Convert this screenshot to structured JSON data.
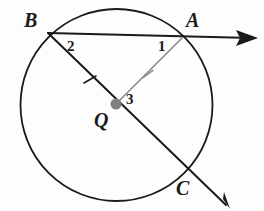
{
  "figure": {
    "type": "geometry-diagram",
    "background_color": "#fdfdfd",
    "stroke_color": "#1a1a1a",
    "accent_color": "#8a8a8a",
    "center_dot_color": "#808080"
  },
  "circle": {
    "name": "circle-Q",
    "center_label": "Q",
    "cx": 116.5,
    "cy": 105,
    "r": 96,
    "stroke": "#1a1a1a",
    "stroke_width": 1.8
  },
  "points": [
    {
      "id": "A",
      "label": "A",
      "x": 182,
      "y": 38,
      "label_x": 186,
      "label_y": 10
    },
    {
      "id": "B",
      "label": "B",
      "x": 48,
      "y": 33,
      "label_x": 24,
      "label_y": 10
    },
    {
      "id": "C",
      "label": "C",
      "x": 187,
      "y": 175,
      "label_x": 176,
      "label_y": 178
    },
    {
      "id": "Q",
      "label": "Q",
      "x": 116,
      "y": 104,
      "label_x": 94,
      "label_y": 110
    }
  ],
  "angles": [
    {
      "id": "1",
      "label": "1",
      "x": 159,
      "y": 40,
      "at_vertex": "A"
    },
    {
      "id": "2",
      "label": "2",
      "x": 68,
      "y": 40,
      "at_vertex": "B"
    },
    {
      "id": "3",
      "label": "3",
      "x": 127,
      "y": 93,
      "at_vertex": "Q"
    }
  ],
  "segments": [
    {
      "id": "ray-BA",
      "name": "ray-b-a",
      "from": "B",
      "to": "arrow-right",
      "x1": 48,
      "y1": 33,
      "x2": 252,
      "y2": 38,
      "color": "#1a1a1a",
      "width": 1.8,
      "arrow_end": true
    },
    {
      "id": "ray-BC",
      "name": "ray-b-through-q-to-c",
      "from": "B",
      "to": "arrow-lower-right",
      "x1": 48,
      "y1": 33,
      "x2": 224,
      "y2": 203,
      "color": "#1a1a1a",
      "width": 2.0,
      "arrow_end": true
    },
    {
      "id": "radius-QA",
      "name": "radius-q-a",
      "from": "Q",
      "to": "A",
      "x1": 116,
      "y1": 104,
      "x2": 182,
      "y2": 38,
      "color": "#8a8a8a",
      "width": 1.6,
      "arrow_end": false
    }
  ],
  "tick_marks": [
    {
      "id": "tick-QB",
      "name": "congruence-tick-radius-qb",
      "x": 90,
      "y": 80,
      "color": "#1a1a1a"
    },
    {
      "id": "tick-QA",
      "name": "congruence-tick-radius-qa",
      "x": 148,
      "y": 73,
      "color": "#8a8a8a"
    }
  ],
  "arrowheads": [
    {
      "id": "arrow-right",
      "name": "arrowhead-right",
      "tip_x": 258,
      "tip_y": 38,
      "angle_deg": 1.4
    },
    {
      "id": "arrow-lower-right",
      "name": "arrowhead-lower-right",
      "tip_x": 230,
      "tip_y": 209,
      "angle_deg": 44
    }
  ]
}
